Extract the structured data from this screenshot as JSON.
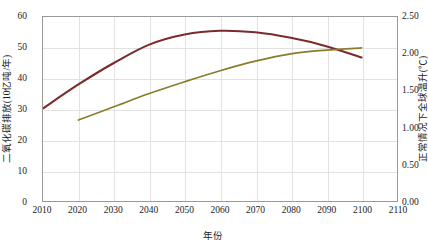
{
  "chart_data": {
    "type": "line",
    "title": "",
    "xlabel": "年份",
    "ylabel": "二氧化碳排放(10亿吨/年)",
    "ylabel_right": "正常情况下全球温升(℃)",
    "xlim": [
      2010,
      2110
    ],
    "ylim": [
      0,
      60
    ],
    "ylim_right": [
      0.0,
      2.5
    ],
    "xticks": [
      "2010",
      "2020",
      "2030",
      "2040",
      "2050",
      "2060",
      "2070",
      "2080",
      "2090",
      "2100",
      "2110"
    ],
    "yticks_left": [
      "0",
      "10",
      "20",
      "30",
      "40",
      "50",
      "60"
    ],
    "yticks_right": [
      "0.00",
      "0.50",
      "1.00",
      "1.50",
      "2.00",
      "2.50"
    ],
    "grid": true,
    "legend": "none",
    "series": [
      {
        "name": "二氧化碳排放",
        "axis": "left",
        "color": "#7a2b2b",
        "x": [
          2010,
          2020,
          2030,
          2040,
          2050,
          2060,
          2070,
          2080,
          2090,
          2100
        ],
        "values": [
          30.2,
          38.0,
          45.0,
          51.0,
          54.3,
          55.5,
          55.0,
          53.2,
          50.5,
          46.8
        ]
      },
      {
        "name": "正常情况下全球温升",
        "axis": "right",
        "color": "#8a7d2a",
        "x": [
          2020,
          2030,
          2040,
          2050,
          2060,
          2070,
          2080,
          2090,
          2100
        ],
        "values": [
          1.1,
          1.28,
          1.46,
          1.62,
          1.77,
          1.9,
          2.0,
          2.05,
          2.08
        ]
      }
    ]
  }
}
